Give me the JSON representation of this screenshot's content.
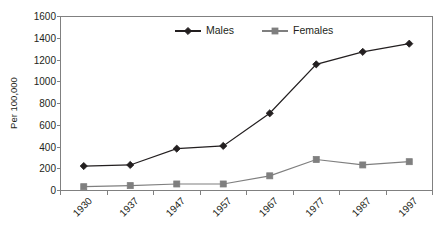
{
  "chart_data": {
    "type": "line",
    "title": "",
    "xlabel": "",
    "ylabel": "Per 100,000",
    "categories": [
      "1930",
      "1937",
      "1947",
      "1957",
      "1967",
      "1977",
      "1987",
      "1997"
    ],
    "series": [
      {
        "name": "Males",
        "values": [
          225,
          235,
          385,
          410,
          710,
          1160,
          1275,
          1350
        ],
        "color": "#231f20",
        "marker": "diamond"
      },
      {
        "name": "Females",
        "values": [
          35,
          45,
          60,
          60,
          135,
          285,
          235,
          265
        ],
        "color": "#7f7f7f",
        "marker": "square"
      }
    ],
    "ylim": [
      0,
      1600
    ],
    "yticks": [
      0,
      200,
      400,
      600,
      800,
      1000,
      1200,
      1400,
      1600
    ],
    "ytick_labels": [
      "0",
      "200",
      "400",
      "600",
      "800",
      "1000",
      "1200",
      "1400",
      "1600"
    ],
    "grid": false,
    "legend_position": "top-center",
    "xtick_rotation": 45
  },
  "legend": {
    "entries": [
      {
        "label": "Males"
      },
      {
        "label": "Females"
      }
    ]
  },
  "axes": {
    "y_title": "Per 100,000"
  },
  "colors": {
    "males": "#231f20",
    "females": "#7f7f7f",
    "axis": "#808080",
    "background": "#ffffff"
  }
}
